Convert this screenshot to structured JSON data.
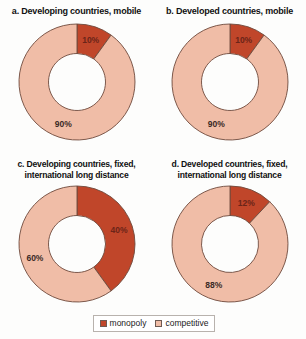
{
  "figure": {
    "background": "#fdfdfc",
    "colors": {
      "monopoly": "#c0462a",
      "competitive": "#f0bda7",
      "outline": "#6e4a3c",
      "label_dark": "#3a2a26",
      "label_on_red": "#6b2418"
    }
  },
  "legend": {
    "items": [
      {
        "label": "monopoly",
        "color": "#c0462a",
        "swatch_name": "legend-swatch-monopoly"
      },
      {
        "label": "competitive",
        "color": "#f0bda7",
        "swatch_name": "legend-swatch-competitive"
      }
    ]
  },
  "chart_data": [
    {
      "type": "pie",
      "id": "a",
      "title": "a. Developing countries, mobile",
      "categories": [
        "monopoly",
        "competitive"
      ],
      "values": [
        10,
        90
      ],
      "labels": [
        "10%",
        "90%"
      ],
      "units": "percent",
      "donut": true,
      "legend_position": "bottom"
    },
    {
      "type": "pie",
      "id": "b",
      "title": "b. Developed countries, mobile",
      "categories": [
        "monopoly",
        "competitive"
      ],
      "values": [
        10,
        90
      ],
      "labels": [
        "10%",
        "90%"
      ],
      "units": "percent",
      "donut": true,
      "legend_position": "bottom"
    },
    {
      "type": "pie",
      "id": "c",
      "title": "c. Developing countries, fixed,\ninternational long distance",
      "categories": [
        "monopoly",
        "competitive"
      ],
      "values": [
        40,
        60
      ],
      "labels": [
        "40%",
        "60%"
      ],
      "units": "percent",
      "donut": true,
      "legend_position": "bottom"
    },
    {
      "type": "pie",
      "id": "d",
      "title": "d. Developed countries, fixed,\ninternational long distance",
      "categories": [
        "monopoly",
        "competitive"
      ],
      "values": [
        12,
        88
      ],
      "labels": [
        "12%",
        "88%"
      ],
      "units": "percent",
      "donut": true,
      "legend_position": "bottom"
    }
  ]
}
